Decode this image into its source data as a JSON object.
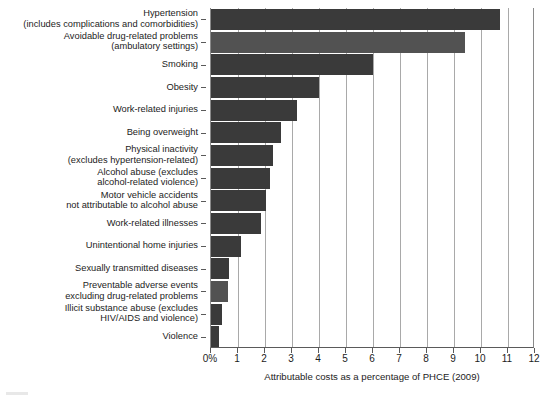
{
  "chart_data": {
    "type": "bar",
    "orientation": "horizontal",
    "title": "",
    "xlabel": "Attributable costs as a percentage of PHCE (2009)",
    "ylabel": "",
    "xlim": [
      0,
      12
    ],
    "xticks": [
      0,
      1,
      2,
      3,
      4,
      5,
      6,
      7,
      8,
      9,
      10,
      11,
      12
    ],
    "xtick_labels": [
      "0%",
      "1",
      "2",
      "3",
      "4",
      "5",
      "6",
      "7",
      "8",
      "9",
      "10",
      "11",
      "12"
    ],
    "grid": "vertical",
    "legend": "none",
    "categories": [
      "Hypertension\n(includes complications and comorbidities)",
      "Avoidable drug-related problems\n(ambulatory settings)",
      "Smoking",
      "Obesity",
      "Work-related injuries",
      "Being overweight",
      "Physical inactivity\n(excludes hypertension-related)",
      "Alcohol abuse (excludes\nalcohol-related violence)",
      "Motor vehicle accidents\nnot attributable to alcohol abuse",
      "Work-related illnesses",
      "Unintentional home injuries",
      "Sexually transmitted diseases",
      "Preventable adverse events\nexcluding drug-related problems",
      "Illicit substance abuse (excludes\nHIV/AIDS and violence)",
      "Violence"
    ],
    "values": [
      10.7,
      9.4,
      6.0,
      4.0,
      3.2,
      2.6,
      2.3,
      2.2,
      2.05,
      1.85,
      1.1,
      0.67,
      0.63,
      0.42,
      0.28
    ],
    "bar_colors": [
      "#3a3a3a",
      "#525252",
      "#3a3a3a",
      "#3a3a3a",
      "#3a3a3a",
      "#3a3a3a",
      "#3a3a3a",
      "#3a3a3a",
      "#3a3a3a",
      "#3a3a3a",
      "#3a3a3a",
      "#3a3a3a",
      "#525252",
      "#3a3a3a",
      "#3a3a3a"
    ]
  },
  "colors": {
    "bar_dark": "#3a3a3a",
    "bar_gray": "#525252",
    "gridline": "#a9a9a9",
    "axis": "#5a5a5a",
    "text": "#1c1c1c",
    "background": "#ffffff"
  }
}
